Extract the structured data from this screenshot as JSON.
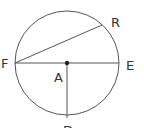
{
  "diagram": {
    "type": "circle-geometry",
    "circle": {
      "cx": 67,
      "cy": 63,
      "r": 52,
      "stroke": "#555555"
    },
    "points": {
      "F": {
        "label": "F",
        "x": 15,
        "y": 63
      },
      "E": {
        "label": "E",
        "x": 119,
        "y": 63
      },
      "A": {
        "label": "A",
        "x": 67,
        "y": 63
      },
      "R": {
        "label": "R",
        "x": 102,
        "y": 25
      },
      "D": {
        "label": "D",
        "x": 67,
        "y": 118
      }
    },
    "segments": [
      {
        "from": "F",
        "to": "E"
      },
      {
        "from": "F",
        "to": "R"
      },
      {
        "from": "A",
        "to": "D"
      }
    ],
    "labels": {
      "F": "F",
      "E": "E",
      "A": "A",
      "R": "R",
      "D": "D"
    }
  }
}
